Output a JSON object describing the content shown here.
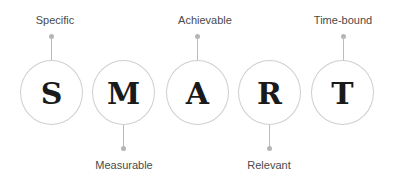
{
  "diagram": {
    "items": [
      {
        "letter": "S",
        "label": "Specific",
        "label_position": "top"
      },
      {
        "letter": "M",
        "label": "Measurable",
        "label_position": "bottom"
      },
      {
        "letter": "A",
        "label": "Achievable",
        "label_position": "top"
      },
      {
        "letter": "R",
        "label": "Relevant",
        "label_position": "bottom"
      },
      {
        "letter": "T",
        "label": "Time-bound",
        "label_position": "top"
      }
    ],
    "colors": {
      "circle_stroke": "#cfcfcf",
      "connector": "#bcbcbc",
      "letter": "#1a1a1a",
      "label": "#4a4a4a",
      "background": "#ffffff"
    }
  }
}
